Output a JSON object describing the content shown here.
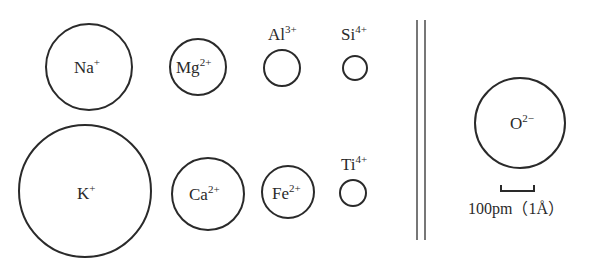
{
  "figure": {
    "ions": [
      {
        "id": "na",
        "symbol": "Na",
        "charge": "+",
        "cx": 89,
        "cy": 67,
        "r": 43,
        "label_pos": "inside"
      },
      {
        "id": "mg",
        "symbol": "Mg",
        "charge": "2+",
        "cx": 198,
        "cy": 67,
        "r": 28,
        "label_pos": "inside"
      },
      {
        "id": "al",
        "symbol": "Al",
        "charge": "3+",
        "cx": 282,
        "cy": 68,
        "r": 18,
        "label_pos": "above"
      },
      {
        "id": "si",
        "symbol": "Si",
        "charge": "4+",
        "cx": 355,
        "cy": 68,
        "r": 12,
        "label_pos": "above"
      },
      {
        "id": "k",
        "symbol": "K",
        "charge": "+",
        "cx": 85,
        "cy": 191,
        "r": 66,
        "label_pos": "inside"
      },
      {
        "id": "ca",
        "symbol": "Ca",
        "charge": "2+",
        "cx": 208,
        "cy": 194,
        "r": 36,
        "label_pos": "inside"
      },
      {
        "id": "fe",
        "symbol": "Fe",
        "charge": "2+",
        "cx": 288,
        "cy": 192,
        "r": 26,
        "label_pos": "inside"
      },
      {
        "id": "ti",
        "symbol": "Ti",
        "charge": "4+",
        "cx": 353,
        "cy": 193,
        "r": 13,
        "label_pos": "above"
      },
      {
        "id": "o",
        "symbol": "O",
        "charge": "2−",
        "cx": 520,
        "cy": 123,
        "r": 45,
        "label_pos": "inside"
      }
    ],
    "labels": {
      "na": {
        "symbol": "Na",
        "charge": "+"
      },
      "mg": {
        "symbol": "Mg",
        "charge": "2+"
      },
      "al": {
        "symbol": "Al",
        "charge": "3+"
      },
      "si": {
        "symbol": "Si",
        "charge": "4+"
      },
      "k": {
        "symbol": "K",
        "charge": "+"
      },
      "ca": {
        "symbol": "Ca",
        "charge": "2+"
      },
      "fe": {
        "symbol": "Fe",
        "charge": "2+"
      },
      "ti": {
        "symbol": "Ti",
        "charge": "4+"
      },
      "o": {
        "symbol": "O",
        "charge": "2−"
      }
    },
    "divider": {
      "x1": 417,
      "x2": 425,
      "y_top": 20,
      "y_bottom": 240
    },
    "scale": {
      "bar_x1": 501,
      "bar_x2": 534,
      "bar_y": 190,
      "label": "100pm（1Å）"
    }
  }
}
